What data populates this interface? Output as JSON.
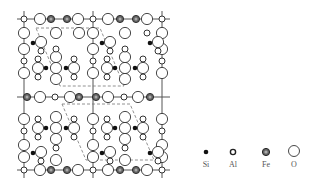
{
  "figure": {
    "colors": {
      "line": "#555555",
      "atom_stroke": "#444444",
      "si_fill": "#111111",
      "fe_fill": "#555555",
      "o_fill": "#ffffff",
      "al_fill": "#ffffff"
    }
  },
  "legend": {
    "items": [
      {
        "symbol": "si",
        "label": "Si"
      },
      {
        "symbol": "al",
        "label": "Al"
      },
      {
        "symbol": "fe",
        "label": "Fe"
      },
      {
        "symbol": "o",
        "label": "O"
      }
    ]
  }
}
